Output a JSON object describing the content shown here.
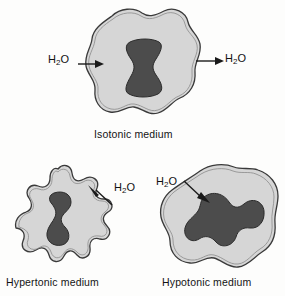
{
  "figure": {
    "background_color": "#fdfdfc",
    "cell_body_color": "#d6d6d6",
    "nucleus_color": "#4c4c4c",
    "outline_color": "#3a3a3a",
    "water_formula_prefix": "H",
    "water_formula_subscript": "2",
    "water_formula_suffix": "O"
  },
  "panels": {
    "isotonic": {
      "caption": "Isotonic medium",
      "cell_name": "isotonic-cell",
      "nucleus_name": "isotonic-nucleus",
      "arrow_in_label": "H2O",
      "arrow_out_label": "H2O",
      "arrow_in_direction": "right",
      "arrow_out_direction": "right",
      "water_in": "H",
      "water_in_sub": "2",
      "water_in_end": "O",
      "water_out": "H",
      "water_out_sub": "2",
      "water_out_end": "O"
    },
    "hypertonic": {
      "caption": "Hypertonic medium",
      "cell_name": "hypertonic-cell",
      "nucleus_name": "hypertonic-nucleus",
      "arrow_label": "H2O",
      "arrow_direction": "out-upper-left",
      "water": "H",
      "water_sub": "2",
      "water_end": "O"
    },
    "hypotonic": {
      "caption": "Hypotonic medium",
      "cell_name": "hypotonic-cell",
      "nucleus_name": "hypotonic-nucleus",
      "arrow_label": "H2O",
      "arrow_direction": "in-lower-right",
      "water": "H",
      "water_sub": "2",
      "water_end": "O"
    }
  }
}
